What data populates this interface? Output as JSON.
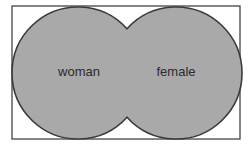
{
  "diagram": {
    "type": "venn",
    "universe": {
      "label": ""
    },
    "sets": [
      {
        "id": "woman",
        "label": "woman"
      },
      {
        "id": "female",
        "label": "female"
      }
    ],
    "colors": {
      "fill": "#a9a9a9",
      "stroke": "#3a3a3a",
      "frame": "#444444",
      "background": "#ffffff"
    }
  }
}
